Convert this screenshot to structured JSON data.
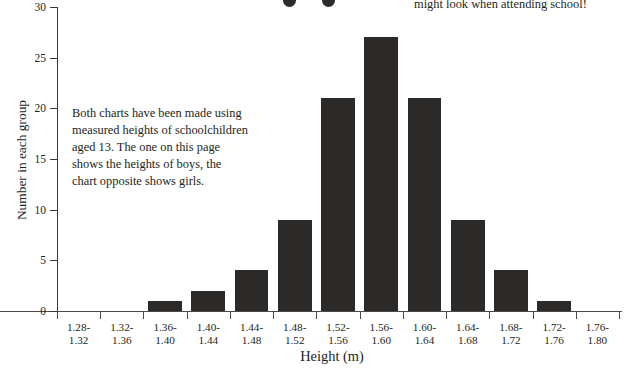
{
  "annotations": {
    "top_right_note": "might look when attending school!",
    "body_note": "Both charts have been made using measured heights of schoolchildren aged 13. The one on this page shows the heights of boys, the chart opposite shows girls.",
    "dot_left": "decorative-dot",
    "dot_right": "decorative-dot"
  },
  "colors": {
    "bar_fill": "#2b2a29",
    "axis": "#4a4a4a",
    "text": "#231f20",
    "background": "#ffffff"
  },
  "chart_data": {
    "type": "bar",
    "title": "",
    "xlabel": "Height (m)",
    "ylabel": "Number in each group",
    "categories": [
      "1.28-\n1.32",
      "1.32-\n1.36",
      "1.36-\n1.40",
      "1.40-\n1.44",
      "1.44-\n1.48",
      "1.48-\n1.52",
      "1.52-\n1.56",
      "1.56-\n1.60",
      "1.60-\n1.64",
      "1.64-\n1.68",
      "1.68-\n1.72",
      "1.72-\n1.76",
      "1.76-\n1.80"
    ],
    "categories_lines": [
      [
        "1.28-",
        "1.32"
      ],
      [
        "1.32-",
        "1.36"
      ],
      [
        "1.36-",
        "1.40"
      ],
      [
        "1.40-",
        "1.44"
      ],
      [
        "1.44-",
        "1.48"
      ],
      [
        "1.48-",
        "1.52"
      ],
      [
        "1.52-",
        "1.56"
      ],
      [
        "1.56-",
        "1.60"
      ],
      [
        "1.60-",
        "1.64"
      ],
      [
        "1.64-",
        "1.68"
      ],
      [
        "1.68-",
        "1.72"
      ],
      [
        "1.72-",
        "1.76"
      ],
      [
        "1.76-",
        "1.80"
      ]
    ],
    "values": [
      0,
      0,
      1,
      2,
      4,
      9,
      21,
      27,
      21,
      9,
      4,
      1,
      0
    ],
    "ylim": [
      0,
      30
    ],
    "yticks": [
      0,
      5,
      10,
      15,
      20,
      25,
      30
    ],
    "ytick_labels": [
      "0",
      "5",
      "10",
      "15",
      "20",
      "25",
      "30"
    ],
    "grid": false,
    "legend": false
  }
}
